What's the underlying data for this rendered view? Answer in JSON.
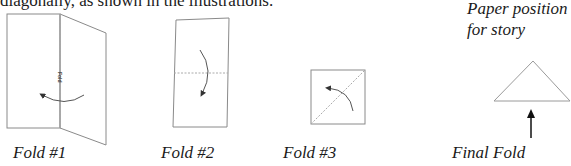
{
  "intro_text": "diagonally, as shown in the illustrations.",
  "note": {
    "line1": "Paper position",
    "line2": "for story"
  },
  "figures": [
    {
      "caption": "Fold #1",
      "inner_label": "Fold"
    },
    {
      "caption": "Fold #2"
    },
    {
      "caption": "Fold #3"
    },
    {
      "caption": "Final Fold"
    }
  ],
  "colors": {
    "line": "#8a8a8a",
    "dotted": "#aaaaaa",
    "arrow": "#555555",
    "bold_arrow": "#111111",
    "text": "#1a1a1a"
  }
}
